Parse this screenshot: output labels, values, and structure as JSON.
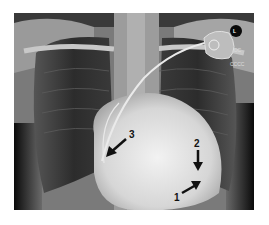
{
  "figure": {
    "type": "chest-radiograph",
    "view": "PA",
    "side_marker": "L",
    "device_text_1": "DC",
    "device_text_2": "CCCC"
  },
  "annotations": [
    {
      "number": "1",
      "arrow_direction": "up-right"
    },
    {
      "number": "2",
      "arrow_direction": "down"
    },
    {
      "number": "3",
      "arrow_direction": "down-left"
    }
  ],
  "colors": {
    "background": "#ffffff",
    "arrow": "#111111",
    "bone": "#d8d8d8",
    "lung_dark": "#2a2a2a",
    "soft_tissue": "#8a8a8a"
  }
}
